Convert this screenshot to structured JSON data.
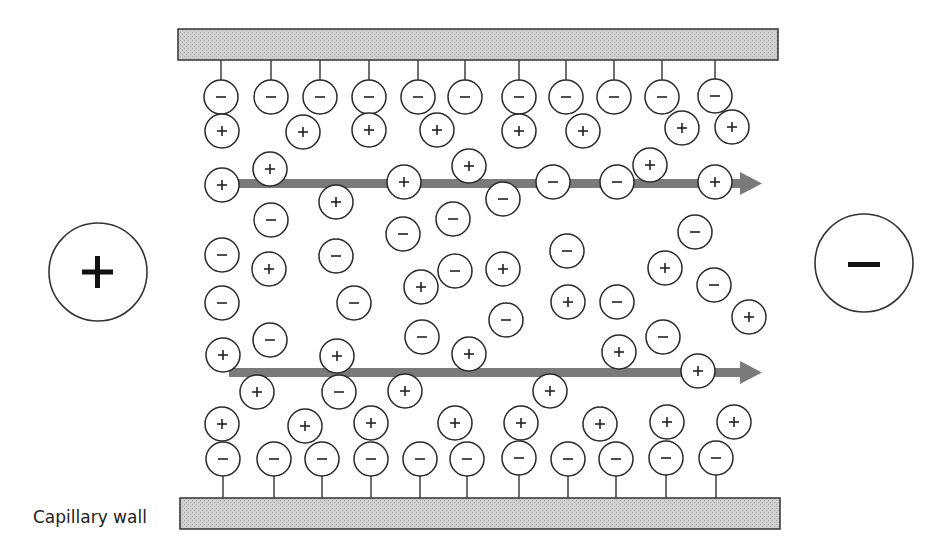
{
  "labels": {
    "capillary_wall": "Capillary wall"
  },
  "electrodes": {
    "anode": {
      "sign": "+",
      "side": "left"
    },
    "cathode": {
      "sign": "−",
      "side": "right"
    }
  },
  "colors": {
    "wall_fill": "#c8c8c8",
    "wall_stroke": "#333333",
    "arrow": "#7a7a7a",
    "ion_stroke": "#2a2a2a"
  },
  "flow_arrows": [
    {
      "direction": "right",
      "row": "upper"
    },
    {
      "direction": "right",
      "row": "lower"
    }
  ],
  "wall_bound_anions_top": [
    "−",
    "−",
    "−",
    "−",
    "−",
    "−",
    "−",
    "−",
    "−",
    "−",
    "−"
  ],
  "wall_bound_anions_bottom": [
    "−",
    "−",
    "−",
    "−",
    "−",
    "−",
    "−",
    "−",
    "−",
    "−",
    "−"
  ],
  "free_ions": [
    {
      "s": "+",
      "x": 222,
      "y": 131
    },
    {
      "s": "+",
      "x": 303,
      "y": 132
    },
    {
      "s": "+",
      "x": 369,
      "y": 130
    },
    {
      "s": "+",
      "x": 437,
      "y": 130
    },
    {
      "s": "+",
      "x": 519,
      "y": 131
    },
    {
      "s": "+",
      "x": 583,
      "y": 131
    },
    {
      "s": "+",
      "x": 682,
      "y": 128
    },
    {
      "s": "+",
      "x": 732,
      "y": 127
    },
    {
      "s": "+",
      "x": 222,
      "y": 185
    },
    {
      "s": "+",
      "x": 270,
      "y": 169
    },
    {
      "s": "+",
      "x": 404,
      "y": 182
    },
    {
      "s": "+",
      "x": 469,
      "y": 166
    },
    {
      "s": "−",
      "x": 503,
      "y": 199
    },
    {
      "s": "−",
      "x": 553,
      "y": 182
    },
    {
      "s": "−",
      "x": 617,
      "y": 182
    },
    {
      "s": "+",
      "x": 650,
      "y": 165
    },
    {
      "s": "+",
      "x": 715,
      "y": 182
    },
    {
      "s": "+",
      "x": 336,
      "y": 202
    },
    {
      "s": "−",
      "x": 271,
      "y": 220
    },
    {
      "s": "−",
      "x": 403,
      "y": 234
    },
    {
      "s": "−",
      "x": 453,
      "y": 219
    },
    {
      "s": "−",
      "x": 695,
      "y": 232
    },
    {
      "s": "−",
      "x": 222,
      "y": 255
    },
    {
      "s": "+",
      "x": 269,
      "y": 269
    },
    {
      "s": "−",
      "x": 336,
      "y": 256
    },
    {
      "s": "−",
      "x": 567,
      "y": 251
    },
    {
      "s": "−",
      "x": 455,
      "y": 271
    },
    {
      "s": "+",
      "x": 503,
      "y": 269
    },
    {
      "s": "+",
      "x": 665,
      "y": 268
    },
    {
      "s": "−",
      "x": 714,
      "y": 285
    },
    {
      "s": "+",
      "x": 421,
      "y": 287
    },
    {
      "s": "−",
      "x": 222,
      "y": 303
    },
    {
      "s": "−",
      "x": 354,
      "y": 303
    },
    {
      "s": "+",
      "x": 568,
      "y": 302
    },
    {
      "s": "−",
      "x": 617,
      "y": 302
    },
    {
      "s": "−",
      "x": 506,
      "y": 320
    },
    {
      "s": "+",
      "x": 749,
      "y": 317
    },
    {
      "s": "−",
      "x": 270,
      "y": 340
    },
    {
      "s": "−",
      "x": 422,
      "y": 337
    },
    {
      "s": "−",
      "x": 663,
      "y": 337
    },
    {
      "s": "+",
      "x": 223,
      "y": 355
    },
    {
      "s": "+",
      "x": 337,
      "y": 356
    },
    {
      "s": "+",
      "x": 469,
      "y": 354
    },
    {
      "s": "+",
      "x": 619,
      "y": 352
    },
    {
      "s": "+",
      "x": 698,
      "y": 371
    },
    {
      "s": "+",
      "x": 257,
      "y": 392
    },
    {
      "s": "−",
      "x": 339,
      "y": 392
    },
    {
      "s": "+",
      "x": 405,
      "y": 391
    },
    {
      "s": "+",
      "x": 550,
      "y": 391
    },
    {
      "s": "+",
      "x": 222,
      "y": 424
    },
    {
      "s": "+",
      "x": 305,
      "y": 426
    },
    {
      "s": "+",
      "x": 371,
      "y": 423
    },
    {
      "s": "+",
      "x": 455,
      "y": 423
    },
    {
      "s": "+",
      "x": 521,
      "y": 423
    },
    {
      "s": "+",
      "x": 600,
      "y": 424
    },
    {
      "s": "+",
      "x": 667,
      "y": 422
    },
    {
      "s": "+",
      "x": 734,
      "y": 422
    }
  ]
}
